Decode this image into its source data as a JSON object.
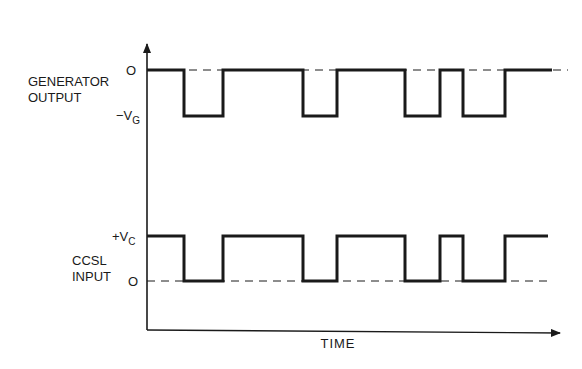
{
  "diagram": {
    "type": "timing-diagram",
    "axes": {
      "x_label": "TIME",
      "origin": [
        147,
        330
      ],
      "y_axis_top": 44,
      "x_axis_end": 560
    },
    "colors": {
      "line": "#1a1a1a",
      "background": "#ffffff"
    },
    "signals": [
      {
        "name": "generator-output",
        "label_line1": "GENERATOR",
        "label_line2": "OUTPUT",
        "level_high_label": "O",
        "level_low_label_prefix": "−V",
        "level_low_label_sub": "G",
        "y_high": 70,
        "y_low": 116,
        "reference_dashed_level": "high",
        "x_start": 147,
        "x_end": 552,
        "dash_end": 568,
        "pulses": [
          [
            184,
            223
          ],
          [
            303,
            337
          ],
          [
            405,
            440
          ],
          [
            463,
            505
          ]
        ]
      },
      {
        "name": "ccsl-input",
        "label_line1": "CCSL",
        "label_line2": "INPUT",
        "level_high_label_prefix": "+V",
        "level_high_label_sub": "C",
        "level_low_label": "O",
        "y_high": 236,
        "y_low": 281,
        "reference_dashed_level": "low",
        "x_start": 147,
        "x_end": 548,
        "dash_end": 552,
        "pulses": [
          [
            184,
            223
          ],
          [
            303,
            337
          ],
          [
            405,
            440
          ],
          [
            463,
            505
          ]
        ]
      }
    ]
  }
}
